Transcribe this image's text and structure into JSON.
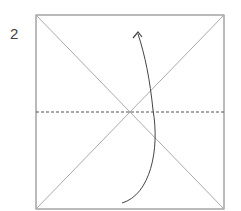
{
  "diagram": {
    "step_number": "2",
    "type": "origami fold instruction",
    "elements": [
      "square paper outline",
      "two diagonal crease lines",
      "horizontal dashed valley fold line",
      "curved arrow pointing upward (fold bottom edge up)"
    ],
    "colors": {
      "outline": "#777777",
      "crease": "#aaaaaa",
      "fold_line": "#555555",
      "arrow": "#444444"
    }
  }
}
